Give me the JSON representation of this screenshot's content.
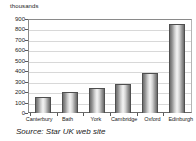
{
  "chart_data": {
    "type": "bar",
    "title": "",
    "subtitle": "",
    "xlabel": "",
    "ylabel": "thousands",
    "categories": [
      "Canterbury",
      "Bath",
      "York",
      "Cambridge",
      "Oxford",
      "Edinburgh"
    ],
    "values": [
      150,
      200,
      240,
      280,
      380,
      855
    ],
    "ylim": [
      0,
      900
    ],
    "y_ticks": [
      900,
      800,
      700,
      600,
      500,
      400,
      300,
      200,
      100,
      0
    ],
    "y_tick_step": 100,
    "grid": true,
    "grid_axis": "y",
    "legend": false,
    "legend_position": "none",
    "bar_style": "cylinder-gradient",
    "series": [
      {
        "name": "Visitors",
        "values": [
          150,
          200,
          240,
          280,
          380,
          855
        ]
      }
    ]
  },
  "caption": {
    "source_text": "Source: Star UK web site"
  },
  "colors": {
    "background": "#ffffff",
    "axis": "#5a5a5a",
    "grid": "#d8d8d8",
    "bar_edge": "#4f4f4f",
    "bar_light": "#f4f4f4",
    "bar_dark": "#6a6a6a",
    "text": "#1a1a1a"
  }
}
